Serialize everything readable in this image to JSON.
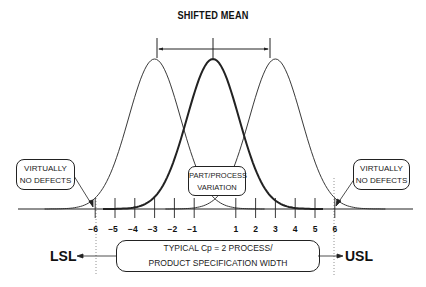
{
  "title": "SHIFTED MEAN",
  "callouts": {
    "left": {
      "line1": "VIRTUALLY",
      "line2": "NO DEFECTS"
    },
    "right": {
      "line1": "VIRTUALLY",
      "line2": "NO DEFECTS"
    },
    "center": {
      "line1": "PART/PROCESS",
      "line2": "VARIATION"
    }
  },
  "axis": {
    "ticks": [
      {
        "value": -6,
        "label": "-6"
      },
      {
        "value": -5,
        "label": "-5"
      },
      {
        "value": -4,
        "label": "-4"
      },
      {
        "value": -3,
        "label": "-3"
      },
      {
        "value": -2,
        "label": "-2"
      },
      {
        "value": -1,
        "label": "-1"
      },
      {
        "value": 1,
        "label": "1"
      },
      {
        "value": 2,
        "label": "2"
      },
      {
        "value": 3,
        "label": "3"
      },
      {
        "value": 4,
        "label": "4"
      },
      {
        "value": 5,
        "label": "5"
      },
      {
        "value": 6,
        "label": "6"
      }
    ]
  },
  "limits": {
    "lower": "LSL",
    "upper": "USL"
  },
  "spec_box": {
    "line1": "TYPICAL Cp = 2 PROCESS/",
    "line2": "PRODUCT SPECIFICATION WIDTH"
  },
  "curves": [
    {
      "name": "shifted-left",
      "mean": -3,
      "bold": false
    },
    {
      "name": "centered",
      "mean": 0,
      "bold": true
    },
    {
      "name": "shifted-right",
      "mean": 3,
      "bold": false
    }
  ]
}
